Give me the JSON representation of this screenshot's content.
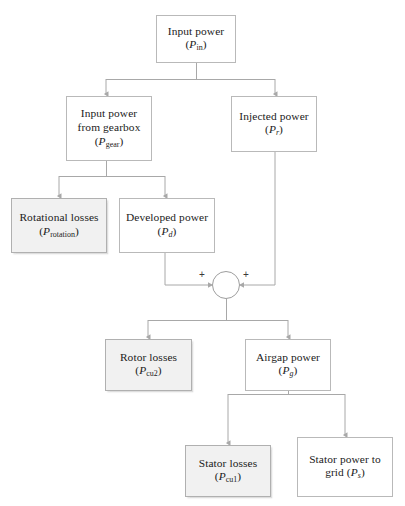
{
  "diagram": {
    "type": "flowchart",
    "line_color": "#9e9e9e",
    "box_border_color": "#b9b9b9",
    "shaded_fill": "#f1f1f1",
    "white_fill": "#ffffff",
    "nodes": [
      {
        "id": "input-power",
        "label_line1": "Input power",
        "label_line2": "(P",
        "sub": "in",
        "label_line2_end": ")",
        "style": "white"
      },
      {
        "id": "input-power-gearbox",
        "label_line1": "Input power",
        "label_line2": "from gearbox",
        "label_line3": "(P",
        "sub": "gear",
        "label_line3_end": ")",
        "style": "white"
      },
      {
        "id": "injected-power",
        "label_line1": "Injected power",
        "label_line2": "(P",
        "sub": "r",
        "label_line2_end": ")",
        "style": "white"
      },
      {
        "id": "rotational-losses",
        "label_line1": "Rotational losses",
        "label_line2": "(P",
        "sub": "rotation",
        "label_line2_end": ")",
        "style": "shaded"
      },
      {
        "id": "developed-power",
        "label_line1": "Developed power",
        "label_line2": "(P",
        "sub": "d",
        "label_line2_end": ")",
        "style": "white"
      },
      {
        "id": "rotor-losses",
        "label_line1": "Rotor losses",
        "label_line2": "(P",
        "sub": "cu2",
        "label_line2_end": ")",
        "style": "shaded"
      },
      {
        "id": "airgap-power",
        "label_line1": "Airgap power",
        "label_line2": "(P",
        "sub": "g",
        "label_line2_end": ")",
        "style": "white"
      },
      {
        "id": "stator-losses",
        "label_line1": "Stator losses",
        "label_line2": "(P",
        "sub": "cu1",
        "label_line2_end": ")",
        "style": "shaded"
      },
      {
        "id": "stator-power-to-grid",
        "label_line1": "Stator power to",
        "label_line2": "grid (P",
        "sub": "s",
        "label_line2_end": ")",
        "style": "white"
      }
    ],
    "summation": {
      "id": "summation-junction",
      "left_operator": "+",
      "right_operator": "+"
    }
  },
  "labels": {
    "input_power": {
      "text": "Input power",
      "symbol": "P",
      "subscript": "in",
      "subscript_italic": false
    },
    "input_power_gearbox": {
      "text_line1": "Input power",
      "text_line2": "from gearbox",
      "symbol": "P",
      "subscript": "gear",
      "subscript_italic": false
    },
    "injected_power": {
      "text": "Injected power",
      "symbol": "P",
      "subscript": "r",
      "subscript_italic": true
    },
    "rotational_losses": {
      "text": "Rotational losses",
      "symbol": "P",
      "subscript": "rotation",
      "subscript_italic": false
    },
    "developed_power": {
      "text": "Developed power",
      "symbol": "P",
      "subscript": "d",
      "subscript_italic": true
    },
    "rotor_losses": {
      "text": "Rotor losses",
      "symbol": "P",
      "subscript": "cu2",
      "subscript_italic": false
    },
    "airgap_power": {
      "text": "Airgap power",
      "symbol": "P",
      "subscript": "g",
      "subscript_italic": true
    },
    "stator_losses": {
      "text": "Stator losses",
      "symbol": "P",
      "subscript": "cu1",
      "subscript_italic": false
    },
    "stator_power_grid": {
      "text_line1": "Stator power to",
      "text_line2": "grid (P",
      "symbol": "P",
      "subscript": "s",
      "subscript_italic": true
    },
    "paren_open": "(",
    "paren_close": ")",
    "plus": "+"
  }
}
